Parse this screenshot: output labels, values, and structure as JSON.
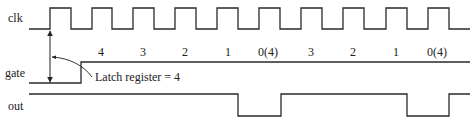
{
  "signals": {
    "clk": {
      "label": "clk"
    },
    "gate": {
      "label": "gate"
    },
    "out": {
      "label": "out"
    }
  },
  "counts": [
    {
      "label": "4",
      "x": 101
    },
    {
      "label": "3",
      "x": 143
    },
    {
      "label": "2",
      "x": 185
    },
    {
      "label": "1",
      "x": 228
    },
    {
      "label": "0(4)",
      "x": 268
    },
    {
      "label": "3",
      "x": 311
    },
    {
      "label": "2",
      "x": 353
    },
    {
      "label": "1",
      "x": 396
    },
    {
      "label": "0(4)",
      "x": 437
    }
  ],
  "annotation": {
    "text": "Latch register = 4"
  },
  "timing": {
    "clk_rising_edges_px": [
      50,
      92,
      133,
      175,
      217,
      259,
      301,
      343,
      386,
      428
    ],
    "clk_high_width_px": 21,
    "gate_rise_px": 81,
    "out_low_pulses_px": [
      [
        238,
        281
      ],
      [
        407,
        449
      ]
    ]
  }
}
